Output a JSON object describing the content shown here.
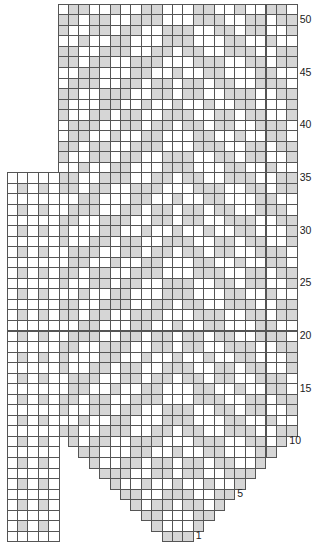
{
  "chart_data": {
    "type": "knitting-chart",
    "title": "",
    "total_rows": 51,
    "row_labels": [
      {
        "row": 1,
        "text": "1"
      },
      {
        "row": 5,
        "text": "5"
      },
      {
        "row": 10,
        "text": "10"
      },
      {
        "row": 15,
        "text": "15"
      },
      {
        "row": 20,
        "text": "20"
      },
      {
        "row": 25,
        "text": "25"
      },
      {
        "row": 30,
        "text": "30"
      },
      {
        "row": 35,
        "text": "35"
      },
      {
        "row": 40,
        "text": "40"
      },
      {
        "row": 45,
        "text": "45"
      },
      {
        "row": 50,
        "text": "50"
      }
    ],
    "main_chart": {
      "columns": 23,
      "shape": "V-shaped bottom: row n (n<=10) spans columns 11-n..11+n; rows 11-51 span full width",
      "shaded_color": "#d6d6d6",
      "cell_color": "#ffffff",
      "grid_color": "#555555"
    },
    "side_chart": {
      "columns": 5,
      "rows_from": 1,
      "rows_to": 35,
      "shaded_rule": "even rows, columns 2 and 4",
      "shaded_columns": [
        1,
        3
      ]
    }
  }
}
